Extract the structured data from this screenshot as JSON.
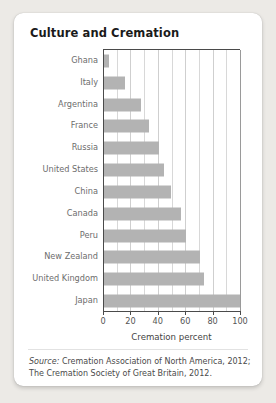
{
  "card": {
    "title": "Culture and Cremation"
  },
  "chart_data": {
    "type": "bar",
    "orientation": "horizontal",
    "title": "Culture and Cremation",
    "xlabel": "Cremation percent",
    "ylabel": "",
    "xlim": [
      0,
      100
    ],
    "xticks": [
      0,
      20,
      40,
      60,
      80,
      100
    ],
    "xtick_labels": [
      "0",
      "20",
      "40",
      "60",
      "80",
      "100"
    ],
    "minor_gridline_step": 10,
    "grid": true,
    "legend": "none",
    "bar_color": "#b3b3b3",
    "categories": [
      "Ghana",
      "Italy",
      "Argentina",
      "France",
      "Russia",
      "United States",
      "China",
      "Canada",
      "Peru",
      "New Zealand",
      "United Kingdom",
      "Japan"
    ],
    "values": [
      4,
      15,
      27,
      33,
      40,
      44,
      49,
      56,
      60,
      70,
      73,
      99
    ]
  },
  "source": {
    "prefix": "Source:",
    "line1": " Cremation Association of North America, 2012;",
    "line2": "The Cremation Society of Great Britain, 2012."
  }
}
